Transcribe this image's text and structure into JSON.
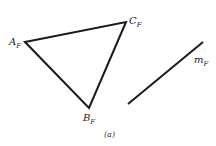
{
  "diagram": {
    "triangle": {
      "vertices": [
        {
          "name": "A",
          "sub": "F",
          "x": 25,
          "y": 42
        },
        {
          "name": "C",
          "sub": "F",
          "x": 126,
          "y": 22
        },
        {
          "name": "B",
          "sub": "F",
          "x": 89,
          "y": 108
        }
      ]
    },
    "line": {
      "name": "m",
      "sub": "F",
      "x1": 128,
      "y1": 104,
      "x2": 203,
      "y2": 42
    },
    "caption": "(a)",
    "stroke_color": "#1a1a1a"
  }
}
